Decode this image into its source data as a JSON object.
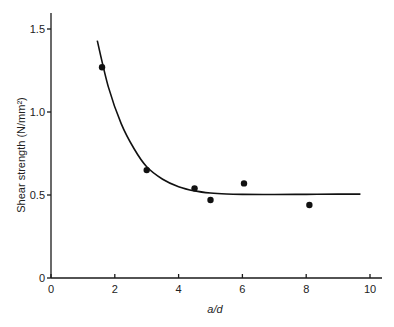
{
  "chart_data": {
    "type": "scatter",
    "title": "",
    "xlabel": "a/d",
    "ylabel": "Shear strength (N/mm²)",
    "xlim": [
      0,
      10
    ],
    "ylim": [
      0,
      1.6
    ],
    "grid": false,
    "legend": null,
    "x_ticks": [
      0,
      2,
      4,
      6,
      8,
      10
    ],
    "x_tick_labels": [
      "0",
      "2",
      "4",
      "6",
      "8",
      "10"
    ],
    "y_ticks": [
      0,
      0.5,
      1.0,
      1.5
    ],
    "y_tick_labels": [
      "0",
      "0.5",
      "1.0",
      "1.5"
    ],
    "series": [
      {
        "name": "measured",
        "kind": "scatter",
        "x": [
          1.6,
          3.0,
          4.5,
          5.0,
          6.05,
          8.1
        ],
        "y": [
          1.27,
          0.65,
          0.54,
          0.47,
          0.57,
          0.44
        ]
      },
      {
        "name": "fitted curve",
        "kind": "line",
        "x": [
          1.45,
          1.8,
          2.2,
          2.6,
          3.0,
          3.5,
          4.0,
          4.5,
          5.0,
          5.5,
          6.0,
          7.0,
          8.0,
          9.0,
          9.7
        ],
        "y": [
          1.43,
          1.15,
          0.93,
          0.78,
          0.67,
          0.595,
          0.55,
          0.525,
          0.512,
          0.506,
          0.504,
          0.503,
          0.504,
          0.505,
          0.505
        ]
      }
    ]
  }
}
